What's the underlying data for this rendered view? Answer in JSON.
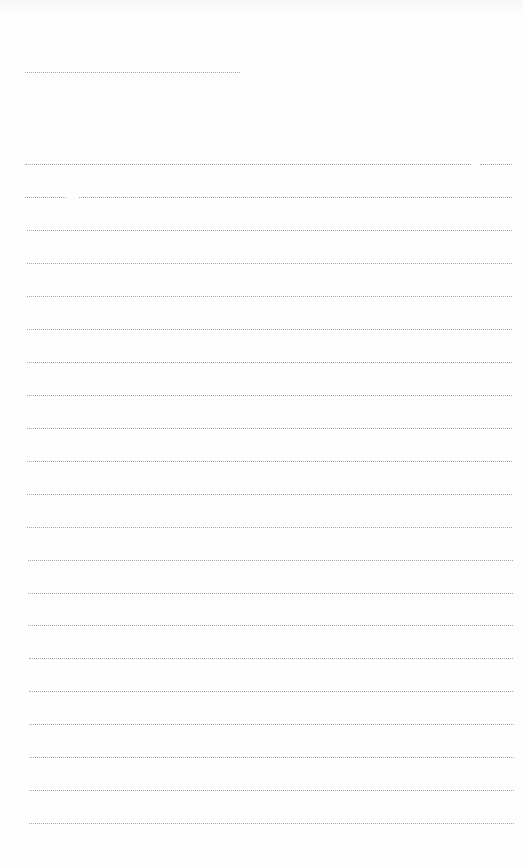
{
  "page": {
    "type": "ruled-blank-page",
    "background": "#fefefe",
    "line_color": "#9a9a9a",
    "header_rule": {
      "y": 72,
      "x1": 25,
      "x2": 240
    },
    "rules": [
      {
        "y": 164,
        "segments": [
          [
            25,
            471
          ],
          [
            480,
            512
          ]
        ]
      },
      {
        "y": 197,
        "segments": [
          [
            25,
            66
          ],
          [
            79,
            512
          ]
        ]
      },
      {
        "y": 230,
        "segments": [
          [
            27,
            512
          ]
        ]
      },
      {
        "y": 263,
        "segments": [
          [
            27,
            512
          ]
        ]
      },
      {
        "y": 296,
        "segments": [
          [
            27,
            512
          ]
        ]
      },
      {
        "y": 329,
        "segments": [
          [
            27,
            512
          ]
        ]
      },
      {
        "y": 362,
        "segments": [
          [
            27,
            512
          ]
        ]
      },
      {
        "y": 395,
        "segments": [
          [
            27,
            512
          ]
        ]
      },
      {
        "y": 428,
        "segments": [
          [
            27,
            512
          ]
        ]
      },
      {
        "y": 461,
        "segments": [
          [
            27,
            512
          ]
        ]
      },
      {
        "y": 494,
        "segments": [
          [
            27,
            512
          ]
        ]
      },
      {
        "y": 527,
        "segments": [
          [
            27,
            512
          ]
        ]
      },
      {
        "y": 560,
        "segments": [
          [
            28,
            513
          ]
        ]
      },
      {
        "y": 593,
        "segments": [
          [
            28,
            513
          ]
        ]
      },
      {
        "y": 625,
        "segments": [
          [
            28,
            513
          ]
        ]
      },
      {
        "y": 658,
        "segments": [
          [
            29,
            513
          ]
        ]
      },
      {
        "y": 691,
        "segments": [
          [
            29,
            513
          ]
        ]
      },
      {
        "y": 724,
        "segments": [
          [
            29,
            514
          ]
        ]
      },
      {
        "y": 757,
        "segments": [
          [
            29,
            514
          ]
        ]
      },
      {
        "y": 790,
        "segments": [
          [
            29,
            514
          ]
        ]
      },
      {
        "y": 823,
        "segments": [
          [
            29,
            514
          ]
        ]
      }
    ]
  }
}
